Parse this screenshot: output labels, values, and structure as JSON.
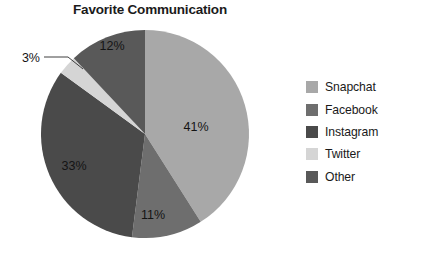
{
  "chart_data": {
    "type": "pie",
    "title": "Favorite Communication",
    "categories": [
      "Snapchat",
      "Facebook",
      "Instagram",
      "Twitter",
      "Other"
    ],
    "values": [
      41,
      11,
      33,
      3,
      12
    ],
    "value_labels": [
      "41%",
      "11%",
      "33%",
      "3%",
      "12%"
    ],
    "colors": [
      "#a8a8a8",
      "#6e6e6e",
      "#4a4a4a",
      "#d5d5d5",
      "#595959"
    ],
    "start_angle_deg": 0,
    "direction": "clockwise",
    "legend_position": "right",
    "grid": false,
    "xlabel": "",
    "ylabel": ""
  },
  "legend": {
    "items": [
      {
        "label": "Snapchat",
        "color": "#a8a8a8"
      },
      {
        "label": "Facebook",
        "color": "#6e6e6e"
      },
      {
        "label": "Instagram",
        "color": "#4a4a4a"
      },
      {
        "label": "Twitter",
        "color": "#d5d5d5"
      },
      {
        "label": "Other",
        "color": "#595959"
      }
    ]
  },
  "slice_labels": {
    "snapchat": "41%",
    "facebook": "11%",
    "instagram": "33%",
    "twitter": "3%",
    "other": "12%"
  },
  "source": {
    "credit": "Source: © 2016 Cengage Learning®"
  }
}
